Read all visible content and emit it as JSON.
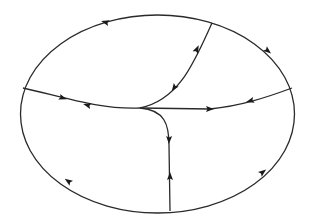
{
  "diagram": {
    "type": "phase-portrait",
    "colors": {
      "background": "#ffffff",
      "stroke": "#2a2a2a",
      "arrow": "#1a1a1a"
    },
    "boundary": {
      "shape": "ellipse",
      "cx": 157.5,
      "cy": 114,
      "rx": 137,
      "ry": 99,
      "orientation": "counterclockwise-on-top, flows along boundary"
    },
    "junction": {
      "x": 140,
      "y": 108
    },
    "curves": [
      {
        "id": "left-branch",
        "d": "M 23 88 C 60 96, 100 110, 140 108"
      },
      {
        "id": "upper-right-branch",
        "d": "M 212 23 C 195 60, 180 100, 140 108"
      },
      {
        "id": "right-branch",
        "d": "M 140 108 L 210 109 C 240 106, 265 98, 292 88"
      },
      {
        "id": "lower-branch",
        "d": "M 140 108 C 165 110, 169 125, 169 145 L 170 211"
      }
    ],
    "arrows": [
      {
        "id": "left-branch-arrow-1",
        "x": 63,
        "y": 98,
        "angle": 18
      },
      {
        "id": "left-branch-arrow-2",
        "x": 87,
        "y": 105,
        "angle": 195
      },
      {
        "id": "upper-branch-arrow-1",
        "x": 197,
        "y": 49,
        "angle": -65
      },
      {
        "id": "upper-branch-arrow-2",
        "x": 174,
        "y": 88,
        "angle": 125
      },
      {
        "id": "right-branch-arrow-1",
        "x": 210,
        "y": 109,
        "angle": 0
      },
      {
        "id": "right-branch-arrow-2",
        "x": 250,
        "y": 101,
        "angle": 165
      },
      {
        "id": "lower-branch-arrow-1",
        "x": 169,
        "y": 140,
        "angle": 92
      },
      {
        "id": "lower-branch-arrow-2",
        "x": 170,
        "y": 176,
        "angle": -90
      },
      {
        "id": "boundary-arrow-top-left",
        "x": 105,
        "y": 22,
        "angle": 195
      },
      {
        "id": "boundary-arrow-top-right",
        "x": 268,
        "y": 51,
        "angle": 40
      },
      {
        "id": "boundary-arrow-bottom-left",
        "x": 68,
        "y": 181,
        "angle": 215
      },
      {
        "id": "boundary-arrow-bottom-right",
        "x": 263,
        "y": 172,
        "angle": -38
      }
    ]
  }
}
